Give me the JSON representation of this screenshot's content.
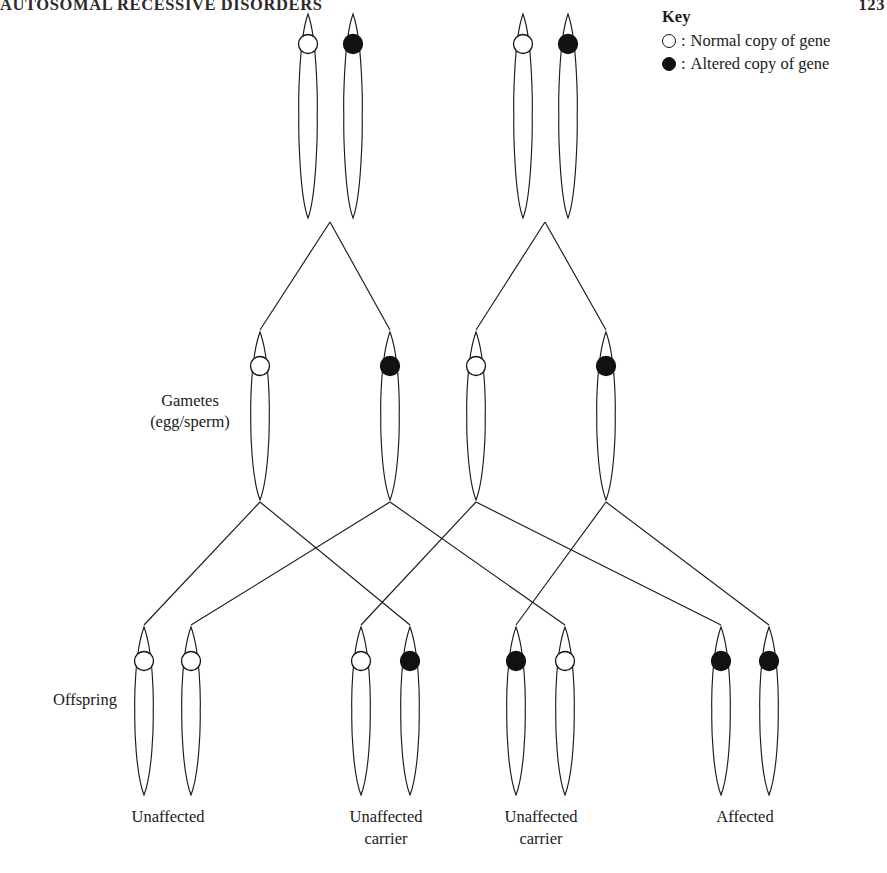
{
  "page": {
    "running_head": "AUTOSOMAL RECESSIVE DISORDERS",
    "folio": "123",
    "background_color": "#ffffff",
    "ink_color": "#1a1a1a"
  },
  "key": {
    "title": "Key",
    "entries": [
      {
        "symbol": "open-circle-icon",
        "separator": ":",
        "label": "Normal copy of gene",
        "fill": "#ffffff",
        "stroke": "#111111"
      },
      {
        "symbol": "filled-circle-icon",
        "separator": ":",
        "label": "Altered copy of gene",
        "fill": "#111111",
        "stroke": "#111111"
      }
    ]
  },
  "row_labels": {
    "gametes_line1": "Gametes",
    "gametes_line2": "(egg/sperm)",
    "offspring": "Offspring"
  },
  "diagram": {
    "type": "punnett-inheritance-pedigree",
    "rows": [
      {
        "name": "parents",
        "y_top": 14,
        "y_bottom": 218,
        "groups": [
          {
            "name": "parent-1",
            "chromosomes": [
              {
                "allele": "normal",
                "cx": 308,
                "circle_y": 44
              },
              {
                "allele": "altered",
                "cx": 353,
                "circle_y": 44
              }
            ]
          },
          {
            "name": "parent-2",
            "chromosomes": [
              {
                "allele": "normal",
                "cx": 523,
                "circle_y": 44
              },
              {
                "allele": "altered",
                "cx": 568,
                "circle_y": 44
              }
            ]
          }
        ]
      },
      {
        "name": "gametes",
        "y_top": 332,
        "y_bottom": 500,
        "chromosomes": [
          {
            "allele": "normal",
            "cx": 260,
            "circle_y": 366
          },
          {
            "allele": "altered",
            "cx": 390,
            "circle_y": 366
          },
          {
            "allele": "normal",
            "cx": 476,
            "circle_y": 366
          },
          {
            "allele": "altered",
            "cx": 606,
            "circle_y": 366
          }
        ]
      },
      {
        "name": "offspring",
        "y_top": 627,
        "y_bottom": 795,
        "groups": [
          {
            "name": "offspring-1",
            "caption_line1": "Unaffected",
            "caption_line2": "",
            "caption_cx": 168,
            "chromosomes": [
              {
                "allele": "normal",
                "cx": 144,
                "circle_y": 661
              },
              {
                "allele": "normal",
                "cx": 191,
                "circle_y": 661
              }
            ]
          },
          {
            "name": "offspring-2",
            "caption_line1": "Unaffected",
            "caption_line2": "carrier",
            "caption_cx": 386,
            "chromosomes": [
              {
                "allele": "normal",
                "cx": 361,
                "circle_y": 661
              },
              {
                "allele": "altered",
                "cx": 410,
                "circle_y": 661
              }
            ]
          },
          {
            "name": "offspring-3",
            "caption_line1": "Unaffected",
            "caption_line2": "carrier",
            "caption_cx": 541,
            "chromosomes": [
              {
                "allele": "altered",
                "cx": 516,
                "circle_y": 661
              },
              {
                "allele": "normal",
                "cx": 565,
                "circle_y": 661
              }
            ]
          },
          {
            "name": "offspring-4",
            "caption_line1": "Affected",
            "caption_line2": "",
            "caption_cx": 745,
            "chromosomes": [
              {
                "allele": "altered",
                "cx": 721,
                "circle_y": 661
              },
              {
                "allele": "altered",
                "cx": 769,
                "circle_y": 661
              }
            ]
          }
        ]
      }
    ],
    "connectors": {
      "parent_to_gamete": [
        {
          "from": "parent-1",
          "from_x": 330,
          "to_x": 260
        },
        {
          "from": "parent-1",
          "from_x": 330,
          "to_x": 390
        },
        {
          "from": "parent-2",
          "from_x": 545,
          "to_x": 476
        },
        {
          "from": "parent-2",
          "from_x": 545,
          "to_x": 606
        }
      ],
      "gamete_to_offspring": [
        {
          "from_x": 260,
          "to_x": 144
        },
        {
          "from_x": 260,
          "to_x": 410
        },
        {
          "from_x": 390,
          "to_x": 191
        },
        {
          "from_x": 390,
          "to_x": 565
        },
        {
          "from_x": 476,
          "to_x": 361
        },
        {
          "from_x": 476,
          "to_x": 721
        },
        {
          "from_x": 606,
          "to_x": 516
        },
        {
          "from_x": 606,
          "to_x": 769
        }
      ]
    }
  }
}
